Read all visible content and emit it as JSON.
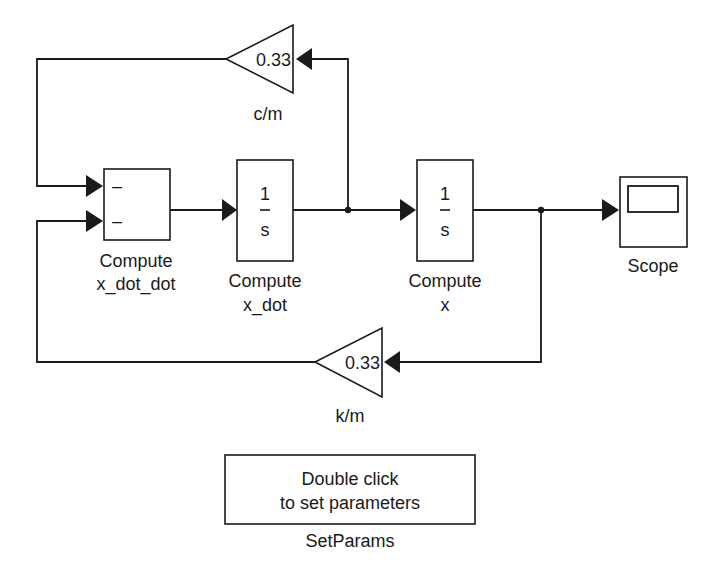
{
  "diagram": {
    "blocks": {
      "sum": {
        "label_line1": "Compute",
        "label_line2": "x_dot_dot",
        "input1_sign": "–",
        "input2_sign": "–"
      },
      "integrator1": {
        "numerator": "1",
        "denominator": "s",
        "label_line1": "Compute",
        "label_line2": "x_dot"
      },
      "integrator2": {
        "numerator": "1",
        "denominator": "s",
        "label_line1": "Compute",
        "label_line2": "x"
      },
      "gain_damping": {
        "value": "0.33",
        "label": "c/m"
      },
      "gain_spring": {
        "value": "0.33",
        "label": "k/m"
      },
      "scope": {
        "label": "Scope",
        "icon": "scope-display-icon"
      },
      "setparams": {
        "line1": "Double click",
        "line2": "to set parameters",
        "label": "SetParams"
      }
    },
    "colors": {
      "line": "#1a1a1a",
      "background": "#ffffff"
    }
  }
}
